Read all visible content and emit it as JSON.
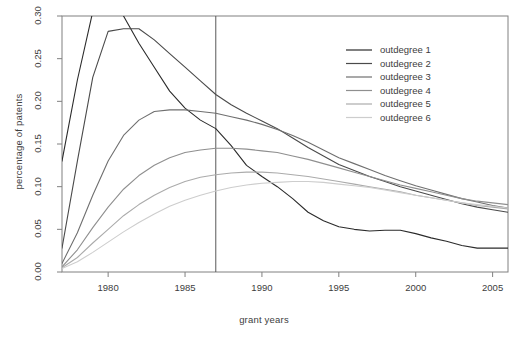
{
  "chart_data": {
    "type": "line",
    "title": "",
    "subtitle": "",
    "xlabel": "grant years",
    "ylabel": "percentage of patents",
    "xlim": [
      1977,
      2006
    ],
    "ylim": [
      0.0,
      0.3
    ],
    "grid": false,
    "legend_position": "top-right",
    "xticks": [
      1980,
      1985,
      1990,
      1995,
      2000,
      2005
    ],
    "xtick_labels": [
      "1980",
      "1985",
      "1990",
      "1995",
      "2000",
      "2005"
    ],
    "yticks": [
      0.0,
      0.05,
      0.1,
      0.15,
      0.2,
      0.25,
      0.3
    ],
    "ytick_labels": [
      "0.00",
      "0.05",
      "0.10",
      "0.15",
      "0.20",
      "0.25",
      "0.30"
    ],
    "annotations": [
      {
        "type": "vertical-line",
        "x": 1987,
        "label": "1987 reference line",
        "color": "#595959"
      }
    ],
    "x": [
      1977,
      1978,
      1979,
      1980,
      1981,
      1982,
      1983,
      1984,
      1985,
      1986,
      1987,
      1988,
      1989,
      1990,
      1991,
      1992,
      1993,
      1994,
      1995,
      1996,
      1997,
      1998,
      1999,
      2000,
      2001,
      2002,
      2003,
      2004,
      2005,
      2006
    ],
    "series": [
      {
        "name": "outdegree 1",
        "color": "#2b2b2b",
        "values": [
          0.13,
          0.225,
          0.305,
          0.33,
          0.3,
          0.268,
          0.24,
          0.212,
          0.192,
          0.178,
          0.168,
          0.148,
          0.125,
          0.112,
          0.1,
          0.086,
          0.07,
          0.06,
          0.053,
          0.05,
          0.048,
          0.049,
          0.049,
          0.045,
          0.04,
          0.036,
          0.031,
          0.028,
          0.028,
          0.028
        ]
      },
      {
        "name": "outdegree 2",
        "color": "#4a4a4a",
        "values": [
          0.028,
          0.13,
          0.228,
          0.282,
          0.285,
          0.285,
          0.272,
          0.256,
          0.24,
          0.224,
          0.208,
          0.196,
          0.186,
          0.177,
          0.168,
          0.157,
          0.146,
          0.136,
          0.126,
          0.119,
          0.112,
          0.106,
          0.1,
          0.095,
          0.09,
          0.085,
          0.08,
          0.076,
          0.073,
          0.07
        ]
      },
      {
        "name": "outdegree 3",
        "color": "#6f6f6f",
        "values": [
          0.01,
          0.046,
          0.09,
          0.13,
          0.16,
          0.178,
          0.188,
          0.19,
          0.19,
          0.188,
          0.186,
          0.182,
          0.178,
          0.173,
          0.167,
          0.16,
          0.152,
          0.143,
          0.134,
          0.127,
          0.12,
          0.113,
          0.107,
          0.101,
          0.096,
          0.091,
          0.086,
          0.082,
          0.078,
          0.075
        ]
      },
      {
        "name": "outdegree 4",
        "color": "#8f8f8f",
        "values": [
          0.006,
          0.026,
          0.052,
          0.076,
          0.097,
          0.113,
          0.125,
          0.134,
          0.14,
          0.143,
          0.145,
          0.145,
          0.144,
          0.142,
          0.14,
          0.136,
          0.132,
          0.127,
          0.122,
          0.117,
          0.112,
          0.107,
          0.102,
          0.098,
          0.094,
          0.09,
          0.086,
          0.083,
          0.081,
          0.079
        ]
      },
      {
        "name": "outdegree 5",
        "color": "#ababab",
        "values": [
          0.005,
          0.017,
          0.034,
          0.05,
          0.066,
          0.079,
          0.09,
          0.099,
          0.106,
          0.111,
          0.114,
          0.116,
          0.117,
          0.117,
          0.116,
          0.114,
          0.112,
          0.109,
          0.106,
          0.103,
          0.1,
          0.097,
          0.094,
          0.09,
          0.087,
          0.084,
          0.081,
          0.078,
          0.076,
          0.074
        ]
      },
      {
        "name": "outdegree 6",
        "color": "#cdcdcd",
        "values": [
          0.004,
          0.012,
          0.023,
          0.035,
          0.047,
          0.058,
          0.068,
          0.077,
          0.084,
          0.09,
          0.095,
          0.099,
          0.102,
          0.104,
          0.105,
          0.106,
          0.106,
          0.105,
          0.103,
          0.101,
          0.099,
          0.096,
          0.093,
          0.09,
          0.087,
          0.084,
          0.081,
          0.079,
          0.077,
          0.075
        ]
      }
    ]
  },
  "legend": {
    "entries": [
      {
        "label": "outdegree 1"
      },
      {
        "label": "outdegree 2"
      },
      {
        "label": "outdegree 3"
      },
      {
        "label": "outdegree 4"
      },
      {
        "label": "outdegree 5"
      },
      {
        "label": "outdegree 6"
      }
    ]
  },
  "style": {
    "frame_color": "#808080",
    "background": "#ffffff",
    "text_color": "#3d3d3d"
  }
}
